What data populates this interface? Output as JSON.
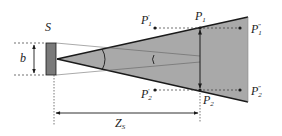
{
  "diagram": {
    "type": "geometric-optics-cone",
    "colors": {
      "cone_fill": "#a9a9a9",
      "source_fill": "#7a7a7a",
      "line": "#1a1a1a",
      "dashed": "#333333",
      "background": "#ffffff"
    },
    "labels": {
      "source": {
        "base": "S",
        "sub": ""
      },
      "width": {
        "base": "b",
        "sub": ""
      },
      "distance": {
        "base": "Z",
        "sub": "S"
      },
      "p1": {
        "base": "P",
        "sub": "1",
        "sup": ""
      },
      "p2": {
        "base": "P",
        "sub": "2",
        "sup": ""
      },
      "p1_prime": {
        "base": "P",
        "sub": "1",
        "sup": "′"
      },
      "p2_prime": {
        "base": "P",
        "sub": "2",
        "sup": "′"
      },
      "p1_dprime": {
        "base": "P",
        "sub": "1",
        "sup": "″"
      },
      "p2_dprime": {
        "base": "P",
        "sub": "2",
        "sup": "″"
      }
    }
  }
}
